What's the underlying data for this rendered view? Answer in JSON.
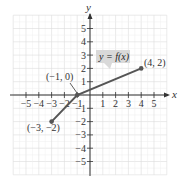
{
  "chart_data": {
    "type": "line",
    "title": "",
    "xlabel": "x",
    "ylabel": "y",
    "xlim": [
      -6,
      6
    ],
    "ylim": [
      -6,
      6
    ],
    "grid": true,
    "x_ticks": [
      "-5",
      "-4",
      "-3",
      "-2",
      "-1",
      "1",
      "2",
      "3",
      "4",
      "5"
    ],
    "y_ticks": [
      "5",
      "4",
      "3",
      "2",
      "1",
      "-1",
      "-2",
      "-3",
      "-4",
      "-5"
    ],
    "series": [
      {
        "name": "y = f(x)",
        "points": [
          [
            -3,
            -2
          ],
          [
            -1,
            0
          ],
          [
            4,
            2
          ]
        ]
      }
    ],
    "annotations": [
      {
        "text": "(-1, 0)",
        "x": -1,
        "y": 0
      },
      {
        "text": "(4, 2)",
        "x": 4,
        "y": 2
      },
      {
        "text": "(-3, -2)",
        "x": -3,
        "y": -2
      }
    ],
    "function_label": "y = f(x)"
  },
  "labels": {
    "x_axis": "x",
    "y_axis": "y",
    "fn": "y = f(x)",
    "p1": "(-1, 0)",
    "p2": "(4, 2)",
    "p3": "(-3, -2)",
    "tx": [
      "-5",
      "-4",
      "-3",
      "-2",
      "-1",
      "1",
      "2",
      "3",
      "4",
      "5"
    ],
    "ty": [
      "5",
      "4",
      "3",
      "2",
      "1",
      "-1",
      "-2",
      "-3",
      "-4",
      "-5"
    ]
  },
  "colors": {
    "grid": "#dcdcdc",
    "axis": "#333333",
    "line": "#555555",
    "label_bg": "#d9d9d9"
  }
}
